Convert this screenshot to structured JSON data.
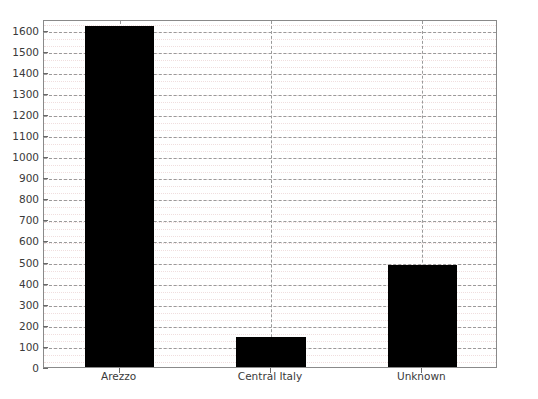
{
  "chart_data": {
    "type": "bar",
    "title": "",
    "subtitle": "",
    "xlabel": "",
    "ylabel": "",
    "categories": [
      "Arezzo",
      "Central Italy",
      "Unknown"
    ],
    "values": [
      1615,
      140,
      483
    ],
    "series": [
      {
        "name": "count",
        "values": [
          1615,
          140,
          483
        ],
        "color": "#000000"
      }
    ],
    "ylim": [
      0,
      1650
    ],
    "xlim": [
      0,
      3
    ],
    "y_ticks": [
      0,
      100,
      200,
      300,
      400,
      500,
      600,
      700,
      800,
      900,
      1000,
      1100,
      1200,
      1300,
      1400,
      1500,
      1600
    ],
    "y_tick_labels": [
      "0",
      "100",
      "200",
      "300",
      "400",
      "500",
      "600",
      "700",
      "800",
      "900",
      "1000",
      "1100",
      "1200",
      "1300",
      "1400",
      "1500",
      "1600"
    ],
    "y_minor_tick_step": 33.3,
    "x_tick_labels": [
      "Arezzo",
      "Central Italy",
      "Unknown"
    ],
    "grid": {
      "major_horizontal": true,
      "minor_horizontal": true,
      "major_vertical": true,
      "major_color": "#9a9a9a",
      "major_style": "dashed",
      "minor_color": "#f0dede",
      "minor_style": "dotted"
    },
    "legend": {
      "visible": false,
      "position": "none",
      "entries": []
    },
    "bar_color": "#000000",
    "background_color": "#ffffff",
    "frame_color": "#8a8a8a",
    "annotations": []
  }
}
